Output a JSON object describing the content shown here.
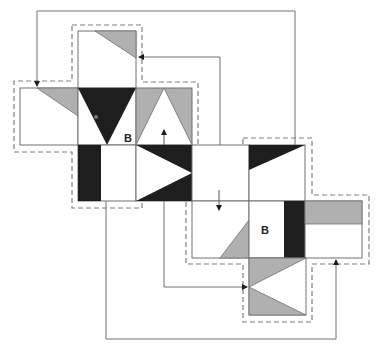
{
  "diagram": {
    "colors": {
      "black": "#1e1e1e",
      "gray": "#b0b0b0",
      "line": "#707070",
      "dashed": "#808080",
      "background": "#ffffff"
    },
    "labels": [
      {
        "id": "label-b-upper",
        "text": "B"
      },
      {
        "id": "label-b-lower",
        "text": "B"
      }
    ],
    "nets": [
      {
        "name": "upper-left-net",
        "faces": [
          "top-face",
          "left-face",
          "center-face",
          "right-face",
          "bottom-face"
        ]
      },
      {
        "name": "lower-right-net",
        "faces": [
          "top-face",
          "left-face",
          "center-face",
          "right-face",
          "bottom-face"
        ]
      }
    ],
    "connectors": [
      "outer-loop-top-arrow",
      "inner-top-arrow",
      "up-arrow",
      "down-arrow",
      "left-bottom-arrow",
      "bottom-loop-arrow"
    ]
  }
}
